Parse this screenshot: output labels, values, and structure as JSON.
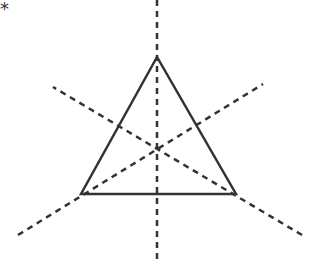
{
  "figure": {
    "corner_mark": "*",
    "triangle": {
      "vertices": [
        [
          157,
          57
        ],
        [
          81,
          194
        ],
        [
          236,
          194
        ]
      ],
      "stroke": "#333333"
    },
    "symmetry_lines": [
      {
        "from": [
          157,
          0
        ],
        "to": [
          157,
          262
        ]
      },
      {
        "from": [
          18,
          235
        ],
        "to": [
          263,
          84
        ]
      },
      {
        "from": [
          302,
          235
        ],
        "to": [
          53,
          87
        ]
      }
    ],
    "line_color": "#333333"
  }
}
